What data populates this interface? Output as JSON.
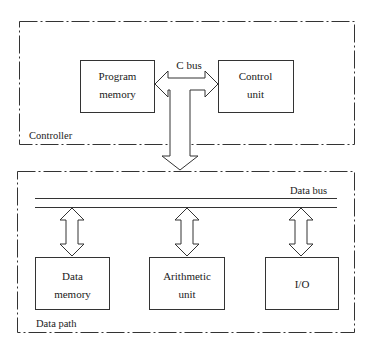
{
  "diagram": {
    "controller": {
      "label": "Controller",
      "blocks": {
        "program_memory": [
          "Program",
          "memory"
        ],
        "control_unit": [
          "Control",
          "unit"
        ]
      },
      "bus_label": "C bus"
    },
    "data_path": {
      "label": "Data path",
      "bus_label": "Data bus",
      "blocks": {
        "data_memory": [
          "Data",
          "memory"
        ],
        "arithmetic_unit": [
          "Arithmetic",
          "unit"
        ],
        "io": [
          "I/O"
        ]
      }
    },
    "colors": {
      "line": "#333333",
      "background": "#ffffff"
    }
  }
}
